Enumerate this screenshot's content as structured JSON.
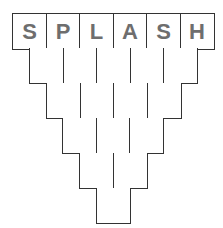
{
  "puzzle": {
    "word": "SPLASH",
    "rows": [
      [
        "S",
        "P",
        "L",
        "A",
        "S",
        "H"
      ],
      [
        "",
        "",
        "",
        "",
        ""
      ],
      [
        "",
        "",
        "",
        ""
      ],
      [
        "",
        "",
        ""
      ],
      [
        "",
        ""
      ],
      [
        ""
      ]
    ],
    "colors": {
      "border": "#333333",
      "letter": "#6e6e6e",
      "background": "#ffffff"
    }
  }
}
